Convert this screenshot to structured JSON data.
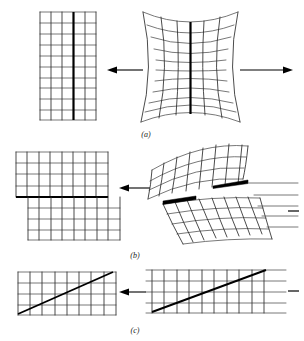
{
  "figure": {
    "background_color": "#ffffff",
    "line_color": "#2b2b2b",
    "bold_line_color": "#000000",
    "width": 304,
    "height": 341,
    "panels": [
      {
        "id": "a",
        "caption": "(a)",
        "caption_x": 146,
        "caption_y": 134,
        "description": "Uniform extension / necking: straight reference grid at left maps from an hourglass-curved deformed grid at right, pulled apart by opposing horizontal arrows.",
        "left_figure": {
          "name": "reference-grid-a",
          "type": "rectangular-grid",
          "x": 40,
          "y": 12,
          "width": 56,
          "height": 108,
          "columns": 5,
          "rows": 10,
          "bold_column_index": 3
        },
        "right_figure": {
          "name": "deformed-grid-a",
          "type": "hourglass-curved-grid",
          "x": 142,
          "y": 10,
          "width": 96,
          "height": 112,
          "columns": 5,
          "rows": 10,
          "bold_column_index": 3,
          "waist_pinch": 14,
          "row_sag": 9
        },
        "arrows": [
          {
            "name": "tension-arrow-left",
            "direction": "left",
            "x1": 143,
            "y1": 70,
            "x2": 108,
            "y2": 70
          },
          {
            "name": "tension-arrow-right",
            "direction": "right",
            "x1": 240,
            "y1": 70,
            "x2": 292,
            "y2": 70
          }
        ]
      },
      {
        "id": "b",
        "caption": "(b)",
        "caption_x": 135,
        "caption_y": 256,
        "description": "Slip / shear on a horizontal plane: reference grid at left is split into two offset blocks across a heavy slip line; deformed state at right is a sheared curvilinear grid with two dark wedge-shaped slip bands.",
        "left_figure": {
          "name": "reference-grid-b",
          "type": "offset-block-grid",
          "x": 16,
          "y": 152,
          "width": 104,
          "height": 88,
          "columns": 8,
          "rows_upper": 4,
          "rows_lower": 4,
          "slip_line_y": 197,
          "upper_block_offset": -12,
          "lower_block_offset": 12
        },
        "right_figure": {
          "name": "deformed-grid-b",
          "type": "sheared-curved-grid",
          "x": 148,
          "y": 146,
          "width": 150,
          "height": 100,
          "columns": 9,
          "rows": 8,
          "slip_bands": 2
        },
        "arrows": [
          {
            "name": "mapping-arrow-b",
            "direction": "left",
            "x1": 148,
            "y1": 188,
            "x2": 120,
            "y2": 188
          }
        ],
        "edge_marks": [
          {
            "name": "edge-dash-b",
            "x1": 288,
            "y1": 211,
            "x2": 299,
            "y2": 211
          }
        ]
      },
      {
        "id": "c",
        "caption": "(c)",
        "caption_x": 135,
        "caption_y": 330,
        "description": "Simple shear along a diagonal: both reference and deformed states are rectangular grids crossed by a heavy diagonal line rising to the right.",
        "left_figure": {
          "name": "reference-grid-c",
          "type": "rectangular-grid-with-diagonal",
          "x": 18,
          "y": 272,
          "width": 98,
          "height": 44,
          "columns": 8,
          "rows": 4,
          "diagonal": {
            "x1": 18,
            "y1": 314,
            "x2": 112,
            "y2": 272
          }
        },
        "right_figure": {
          "name": "deformed-grid-c",
          "type": "rectangular-grid-with-diagonal",
          "x": 146,
          "y": 270,
          "width": 140,
          "height": 44,
          "columns": 10,
          "rows": 4,
          "diagonal": {
            "x1": 152,
            "y1": 312,
            "x2": 266,
            "y2": 270
          }
        },
        "arrows": [
          {
            "name": "mapping-arrow-c",
            "direction": "left",
            "x1": 146,
            "y1": 292,
            "x2": 118,
            "y2": 292
          }
        ],
        "edge_marks": [
          {
            "name": "edge-dash-c",
            "x1": 288,
            "y1": 291,
            "x2": 299,
            "y2": 291
          }
        ]
      }
    ]
  }
}
